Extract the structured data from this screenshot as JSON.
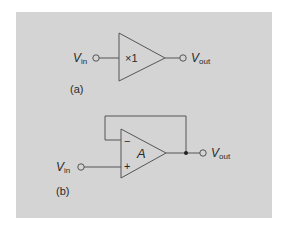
{
  "colors": {
    "background": "#ffffff",
    "panel": "#d4d4d4",
    "stroke": "#555555",
    "text": "#2a2a2a"
  },
  "panel_a": {
    "label": "(a)",
    "input_label": {
      "main": "V",
      "sub": "in"
    },
    "output_label": {
      "main": "V",
      "sub": "out"
    },
    "gain_text": "×1",
    "component": "unity-gain buffer"
  },
  "panel_b": {
    "label": "(b)",
    "input_label": {
      "main": "V",
      "sub": "in"
    },
    "output_label": {
      "main": "V",
      "sub": "out"
    },
    "amp_text": "A",
    "inverting_sign": "−",
    "noninverting_sign": "+",
    "component": "op-amp voltage follower with feedback"
  }
}
